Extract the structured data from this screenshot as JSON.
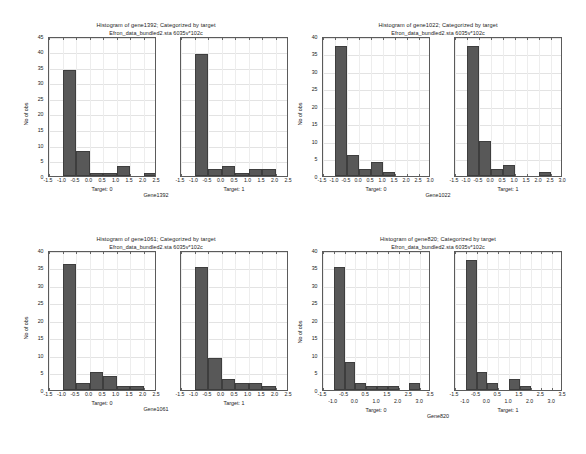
{
  "page": {
    "subtitle_common": "Efron_data_bundled2.sta 6035v*102c",
    "y_axis_label": "No of obs",
    "bar_color": "#585858",
    "background": "#ffffff"
  },
  "figures": [
    {
      "id": "gene1392",
      "title": "Histogram of gene1392; Categorized by target",
      "subtitle": "Efron_data_bundled2.sta 6035v*102c",
      "variable_label": "Gene1392",
      "y_label": "No of obs",
      "panels": [
        {
          "caption": "Target: 0"
        },
        {
          "caption": "Target: 1"
        }
      ]
    },
    {
      "id": "gene1022",
      "title": "Histogram of gene1022; Categorized by target",
      "subtitle": "Efron_data_bundled2.sta 6035v*102c",
      "variable_label": "Gene1022",
      "y_label": "No of obs",
      "panels": [
        {
          "caption": "Target: 0"
        },
        {
          "caption": "Target: 1"
        }
      ]
    },
    {
      "id": "gene1061",
      "title": "Histogram of gene1061; Categorized by target",
      "subtitle": "Efron_data_bundled2.sta 6035v*102c",
      "variable_label": "Gene1061",
      "y_label": "No of obs",
      "panels": [
        {
          "caption": "Target: 0"
        },
        {
          "caption": "Target: 1"
        }
      ]
    },
    {
      "id": "gene820",
      "title": "Histogram of gene820; Categorized by target",
      "subtitle": "Efron_data_bundled2.sta 6035v*102c",
      "variable_label": "Gene820",
      "y_label": "No of obs",
      "panels": [
        {
          "caption": "Target: 0"
        },
        {
          "caption": "Target: 1"
        }
      ]
    }
  ],
  "chart_data": [
    {
      "type": "bar",
      "id": "gene1392-target0",
      "title": "Histogram of gene1392; Categorized by target",
      "subtitle": "Efron_data_bundled2.sta 6035v*102c",
      "xlabel": "Target: 0",
      "ylabel": "No of obs",
      "variable": "Gene1392",
      "xlim": [
        -1.5,
        2.5
      ],
      "ylim": [
        0,
        45
      ],
      "ytick_step": 5,
      "yticks": [
        0,
        5,
        10,
        15,
        20,
        25,
        30,
        35,
        40,
        45
      ],
      "xticks": [
        -1.5,
        -1.0,
        -0.5,
        0.0,
        0.5,
        1.0,
        1.5,
        2.0,
        2.5
      ],
      "xtick_labels": [
        "-1.5",
        "-1.0",
        "-0.5",
        "0.0",
        "0.5",
        "1.0",
        "1.5",
        "2.0",
        "2.5"
      ],
      "bin_width": 0.5,
      "bin_edges": [
        -1.0,
        -0.5,
        0.0,
        0.5,
        1.0,
        1.5,
        2.0,
        2.5
      ],
      "values": [
        34,
        8,
        1,
        1,
        3,
        0,
        1
      ],
      "grid": true
    },
    {
      "type": "bar",
      "id": "gene1392-target1",
      "title": "Histogram of gene1392; Categorized by target",
      "subtitle": "Efron_data_bundled2.sta 6035v*102c",
      "xlabel": "Target: 1",
      "ylabel": "No of obs",
      "variable": "Gene1392",
      "xlim": [
        -1.5,
        2.5
      ],
      "ylim": [
        0,
        45
      ],
      "ytick_step": 5,
      "yticks": [
        0,
        5,
        10,
        15,
        20,
        25,
        30,
        35,
        40,
        45
      ],
      "xticks": [
        -1.5,
        -1.0,
        -0.5,
        0.0,
        0.5,
        1.0,
        1.5,
        2.0,
        2.5
      ],
      "xtick_labels": [
        "-1.5",
        "-1.0",
        "-0.5",
        "0.0",
        "0.5",
        "1.0",
        "1.5",
        "2.0",
        "2.5"
      ],
      "bin_width": 0.5,
      "bin_edges": [
        -1.0,
        -0.5,
        0.0,
        0.5,
        1.0,
        1.5,
        2.0
      ],
      "values": [
        39,
        2,
        3,
        1,
        2,
        2
      ],
      "grid": true
    },
    {
      "type": "bar",
      "id": "gene1022-target0",
      "title": "Histogram of gene1022; Categorized by target",
      "subtitle": "Efron_data_bundled2.sta 6035v*102c",
      "xlabel": "Target: 0",
      "ylabel": "No of obs",
      "variable": "Gene1022",
      "xlim": [
        -1.5,
        3.0
      ],
      "ylim": [
        0,
        40
      ],
      "ytick_step": 5,
      "yticks": [
        0,
        5,
        10,
        15,
        20,
        25,
        30,
        35,
        40
      ],
      "xticks": [
        -1.5,
        -1.0,
        -0.5,
        0.0,
        0.5,
        1.0,
        1.5,
        2.0,
        2.5,
        3.0
      ],
      "xtick_labels": [
        "-1.5",
        "-1.0",
        "-0.5",
        "0.0",
        "0.5",
        "1.0",
        "1.5",
        "2.0",
        "2.5",
        "3.0"
      ],
      "bin_width": 0.5,
      "bin_edges": [
        -1.0,
        -0.5,
        0.0,
        0.5,
        1.0
      ],
      "values": [
        37,
        6,
        2,
        4,
        1
      ],
      "grid": true
    },
    {
      "type": "bar",
      "id": "gene1022-target1",
      "title": "Histogram of gene1022; Categorized by target",
      "subtitle": "Efron_data_bundled2.sta 6035v*102c",
      "xlabel": "Target: 1",
      "ylabel": "No of obs",
      "variable": "Gene1022",
      "xlim": [
        -1.5,
        3.0
      ],
      "ylim": [
        0,
        40
      ],
      "ytick_step": 5,
      "yticks": [
        0,
        5,
        10,
        15,
        20,
        25,
        30,
        35,
        40
      ],
      "xticks": [
        -1.5,
        -1.0,
        -0.5,
        0.0,
        0.5,
        1.0,
        1.5,
        2.0,
        2.5,
        3.0
      ],
      "xtick_labels": [
        "-1.5",
        "-1.0",
        "-0.5",
        "0.0",
        "0.5",
        "1.0",
        "1.5",
        "2.0",
        "2.5",
        "3.0"
      ],
      "bin_width": 0.5,
      "bin_edges": [
        -1.0,
        -0.5,
        0.0,
        0.5,
        1.0,
        1.5,
        2.0
      ],
      "values": [
        37,
        10,
        2,
        3,
        0,
        0,
        1
      ],
      "grid": true
    },
    {
      "type": "bar",
      "id": "gene1061-target0",
      "title": "Histogram of gene1061; Categorized by target",
      "subtitle": "Efron_data_bundled2.sta 6035v*102c",
      "xlabel": "Target: 0",
      "ylabel": "No of obs",
      "variable": "Gene1061",
      "xlim": [
        -1.5,
        2.5
      ],
      "ylim": [
        0,
        40
      ],
      "ytick_step": 5,
      "yticks": [
        0,
        5,
        10,
        15,
        20,
        25,
        30,
        35,
        40
      ],
      "xticks": [
        -1.5,
        -1.0,
        -0.5,
        0.0,
        0.5,
        1.0,
        1.5,
        2.0,
        2.5
      ],
      "xtick_labels": [
        "-1.5",
        "-1.0",
        "-0.5",
        "0.0",
        "0.5",
        "1.0",
        "1.5",
        "2.0",
        "2.5"
      ],
      "bin_width": 0.5,
      "bin_edges": [
        -1.0,
        -0.5,
        0.0,
        0.5,
        1.0,
        1.5
      ],
      "values": [
        36,
        2,
        5,
        4,
        1,
        1
      ],
      "grid": true
    },
    {
      "type": "bar",
      "id": "gene1061-target1",
      "title": "Histogram of gene1061; Categorized by target",
      "subtitle": "Efron_data_bundled2.sta 6035v*102c",
      "xlabel": "Target: 1",
      "ylabel": "No of obs",
      "variable": "Gene1061",
      "xlim": [
        -1.5,
        2.5
      ],
      "ylim": [
        0,
        40
      ],
      "ytick_step": 5,
      "yticks": [
        0,
        5,
        10,
        15,
        20,
        25,
        30,
        35,
        40
      ],
      "xticks": [
        -1.5,
        -1.0,
        -0.5,
        0.0,
        0.5,
        1.0,
        1.5,
        2.0,
        2.5
      ],
      "xtick_labels": [
        "-1.5",
        "-1.0",
        "-0.5",
        "0.0",
        "0.5",
        "1.0",
        "1.5",
        "2.0",
        "2.5"
      ],
      "bin_width": 0.5,
      "bin_edges": [
        -1.0,
        -0.5,
        0.0,
        0.5,
        1.0,
        1.5
      ],
      "values": [
        35,
        9,
        3,
        2,
        2,
        1
      ],
      "grid": true
    },
    {
      "type": "bar",
      "id": "gene820-target0",
      "title": "Histogram of gene820; Categorized by target",
      "subtitle": "Efron_data_bundled2.sta 6035v*102c",
      "xlabel": "Target: 0",
      "ylabel": "No of obs",
      "variable": "Gene820",
      "xlim": [
        -1.5,
        3.5
      ],
      "ylim": [
        0,
        40
      ],
      "ytick_step": 5,
      "yticks": [
        0,
        5,
        10,
        15,
        20,
        25,
        30,
        35,
        40
      ],
      "xticks": [
        -1.5,
        -1.0,
        -0.5,
        0.0,
        0.5,
        1.0,
        1.5,
        2.0,
        2.5,
        3.0,
        3.5
      ],
      "xtick_labels": [
        "-1.5",
        "-1.0",
        "-0.5",
        "0.0",
        "0.5",
        "1.0",
        "1.5",
        "2.0",
        "2.5",
        "3.0",
        "3.5"
      ],
      "xtick_stagger": true,
      "bin_width": 0.5,
      "bin_edges": [
        -1.0,
        -0.5,
        0.0,
        0.5,
        1.0,
        1.5,
        2.5
      ],
      "values": [
        35,
        8,
        2,
        1,
        1,
        1,
        2
      ],
      "grid": true
    },
    {
      "type": "bar",
      "id": "gene820-target1",
      "title": "Histogram of gene820; Categorized by target",
      "subtitle": "Efron_data_bundled2.sta 6035v*102c",
      "xlabel": "Target: 1",
      "ylabel": "No of obs",
      "variable": "Gene820",
      "xlim": [
        -1.5,
        3.5
      ],
      "ylim": [
        0,
        40
      ],
      "ytick_step": 5,
      "yticks": [
        0,
        5,
        10,
        15,
        20,
        25,
        30,
        35,
        40
      ],
      "xticks": [
        -1.5,
        -1.0,
        -0.5,
        0.0,
        0.5,
        1.0,
        1.5,
        2.0,
        2.5,
        3.0,
        3.5
      ],
      "xtick_labels": [
        "-1.5",
        "-1.0",
        "-0.5",
        "0.0",
        "0.5",
        "1.0",
        "1.5",
        "2.0",
        "2.5",
        "3.0",
        "3.5"
      ],
      "xtick_stagger": true,
      "bin_width": 0.5,
      "bin_edges": [
        -1.0,
        -0.5,
        0.0,
        1.0,
        1.5
      ],
      "values": [
        37,
        5,
        2,
        3,
        1
      ],
      "grid": true
    }
  ],
  "layout": {
    "figure_positions": [
      {
        "left": 22,
        "top": 22,
        "width": 268,
        "height": 205
      },
      {
        "left": 296,
        "top": 22,
        "width": 284,
        "height": 205
      },
      {
        "left": 22,
        "top": 236,
        "width": 268,
        "height": 210
      },
      {
        "left": 296,
        "top": 236,
        "width": 284,
        "height": 210
      }
    ],
    "panel_plot_width": 108,
    "panel_plot_height": 140
  }
}
